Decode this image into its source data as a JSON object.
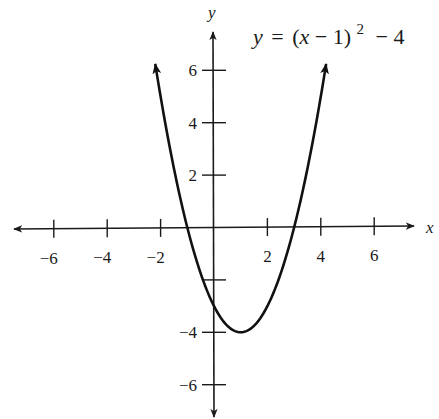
{
  "chart_data": {
    "type": "line",
    "equation": {
      "lhs": "y",
      "eq": "=",
      "base": "(x − 1)",
      "exponent": "2",
      "tail": "− 4"
    },
    "xlabel": "x",
    "ylabel": "y",
    "xlim": [
      -7.5,
      7.5
    ],
    "ylim": [
      -7.2,
      7.4
    ],
    "x_ticks": [
      -6,
      -4,
      -2,
      2,
      4,
      6
    ],
    "x_tick_labels": [
      "−6",
      "−4",
      "−2",
      "2",
      "4",
      "6"
    ],
    "y_ticks": [
      6,
      4,
      2,
      -4,
      -6
    ],
    "y_tick_labels": [
      "6",
      "4",
      "2",
      "−4",
      "−6"
    ],
    "y_minor_ticks_unlabeled": [
      -2
    ],
    "grid": false,
    "legend": null,
    "series": [
      {
        "name": "y = (x − 1)² − 4",
        "function": "(x-1)^2-4",
        "x_range": [
          -2.2,
          4.2
        ],
        "arrows_at_ends": true,
        "key_points": {
          "vertex": [
            1,
            -4
          ],
          "x_intercepts": [
            -1,
            3
          ],
          "y_intercept": [
            0,
            -3
          ]
        },
        "x": [
          -2.2,
          -2,
          -1,
          0,
          1,
          2,
          3,
          4,
          4.2
        ],
        "y": [
          6.24,
          5,
          0,
          -3,
          -4,
          -3,
          0,
          5,
          6.24
        ]
      }
    ],
    "colors": {
      "axis": "#1a1a1a",
      "curve": "#111111",
      "background": "#ffffff"
    }
  }
}
